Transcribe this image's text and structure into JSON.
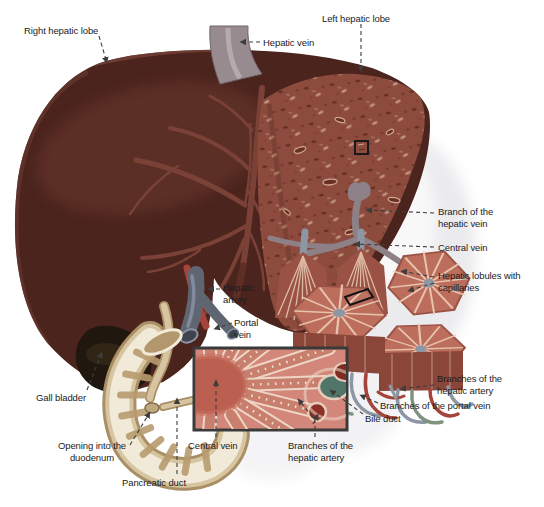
{
  "labels": {
    "right_hepatic_lobe": "Right hepatic lobe",
    "left_hepatic_lobe": "Left hepatic lobe",
    "hepatic_vein": "Hepatic vein",
    "branch_of_hepatic_vein": "Branch of the hepatic vein",
    "central_vein": "Central vein",
    "hepatic_lobules_with_capillaries": "Hepatic lobules with capillaries",
    "hepatic_artery": "Hepatic artery",
    "portal_vein": "Portal vein",
    "gall_bladder": "Gall bladder",
    "opening_into_duodenum": "Opening into the duodenum",
    "pancreatic_duct": "Pancreatic duct",
    "inset_central_vein": "Central vein",
    "inset_branches_hepatic_artery": "Branches of the hepatic artery",
    "branches_hepatic_artery": "Branches of the hepatic artery",
    "branches_portal_vein": "Branches of the portal vein",
    "bile_duct": "Bile duct"
  },
  "colors": {
    "background": "#ffffff",
    "label_text": "#1c1c1c",
    "leader": "#3d3d3d",
    "liver_dark": "#4b241e",
    "liver_highlight": "#7a4136",
    "cut_face": "#8d4b3d",
    "cut_speck_dark": "#58281f",
    "cut_speck_light": "#c99e87",
    "hepatic_vein_gray": "#988b90",
    "silhouette": "#ebebee",
    "lobule_top": "#bc6d5b",
    "lobule_side": "#9a5244",
    "lobule_line": "#eed3bd",
    "vein_gray_blue": "#8d97a4",
    "artery_red": "#a5443a",
    "duct_green": "#7e9480",
    "portal_vein": "#5f6672",
    "duodenum": "#d7c4a1",
    "duodenum_fold": "#b89c6f",
    "duodenum_cut": "#f2ead8",
    "gall_bladder": "#20170e",
    "inset_bg": "#d2877a",
    "inset_vein": "#bb5f51",
    "inset_cord": "#c97f6e",
    "inset_cord_line": "#eed6c6",
    "inset_artery": "#8c2f26",
    "inset_bile": "#517568"
  }
}
